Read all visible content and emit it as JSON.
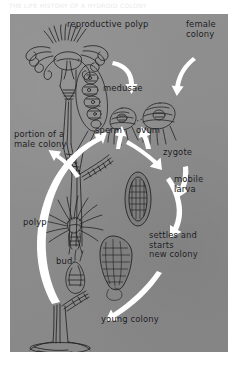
{
  "figure": {
    "caption_top": "THE LIFE HISTORY OF A HYDROID COLONY",
    "panel_color": "#8d8d8d",
    "ink_color": "#17171a",
    "arrow_color": "#ffffff"
  },
  "labels": {
    "reproductive_polyp": "reproductive polyp",
    "female_colony": "female\ncolony",
    "medusae": "medusae",
    "sperm": "sperm",
    "ovum": "ovum",
    "zygote": "zygote",
    "mobile_larva": "mobile\nlarva",
    "portion_male_colony": "portion of a\nmale colony",
    "polyp": "polyp",
    "bud": "bud",
    "settles_starts": "settles and\nstarts\nnew colony",
    "young_colony": "young colony"
  }
}
